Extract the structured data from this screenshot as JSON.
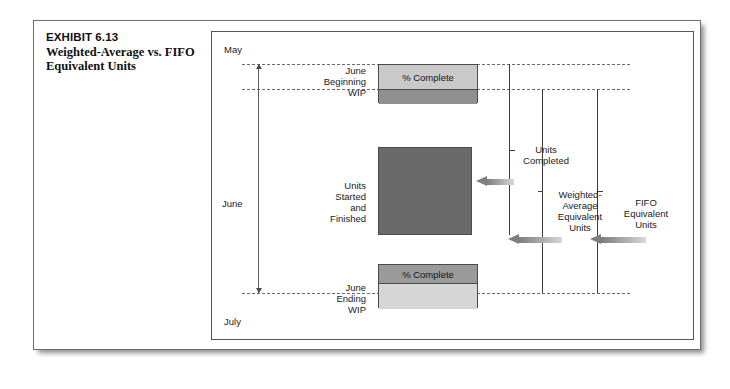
{
  "exhibit": {
    "number": "EXHIBIT 6.13",
    "title": "Weighted-Average vs. FIFO Equivalent Units"
  },
  "diagram": {
    "months": {
      "start": "May",
      "span": "June",
      "end": "July"
    },
    "stages": [
      {
        "id": "beginning-wip",
        "label": "June\nBeginning\nWIP",
        "box_top_text": "% Complete",
        "box_bottom_text": "",
        "top_fill": "#c9c9c9",
        "bottom_fill": "#8f8f8f"
      },
      {
        "id": "units-started",
        "label": "Units\nStarted\nand\nFinished",
        "box_top_text": "",
        "box_bottom_text": "",
        "top_fill": "#6a6a6a",
        "bottom_fill": "#6a6a6a"
      },
      {
        "id": "ending-wip",
        "label": "June\nEnding\nWIP",
        "box_top_text": "% Complete",
        "box_bottom_text": "",
        "top_fill": "#9a9a9a",
        "bottom_fill": "#d6d6d6"
      }
    ],
    "measures": [
      {
        "id": "units-completed",
        "label": "Units\nCompleted"
      },
      {
        "id": "weighted-average-equivalent-units",
        "label": "Weighted-\nAverage\nEquivalent\nUnits"
      },
      {
        "id": "fifo-equivalent-units",
        "label": "FIFO\nEquivalent\nUnits"
      }
    ]
  },
  "colors": {
    "frame_border": "#6e6e6e",
    "panel_border": "#555555",
    "dash_line": "#6b6b6b",
    "arrow": "#7f7f7f",
    "text": "#1a1a1a"
  }
}
